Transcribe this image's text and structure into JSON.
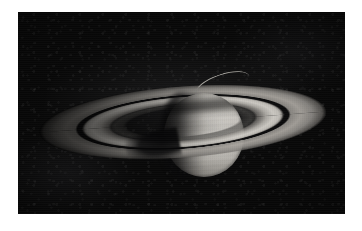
{
  "image": {
    "subject": "Saturn",
    "description": "Telescopic grayscale photograph of the planet Saturn with its ring system, seen against a black star field",
    "caption": "",
    "orientation": "landscape",
    "color_mode": "grayscale",
    "canvas": {
      "width": 362,
      "height": 231
    },
    "border": {
      "style": "white matte border",
      "color": "#ffffff"
    },
    "field": {
      "name": "sky-background",
      "color": "#080808",
      "left": 18,
      "top": 12,
      "width": 327,
      "height": 202
    }
  },
  "objects": {
    "globe": {
      "name": "saturn-globe",
      "center_x": 186,
      "center_y": 123,
      "radius_x": 40,
      "radius_y": 42,
      "lit_side": "right",
      "brightest_tone": "#d4d1cb",
      "terminator_tone": "#121111",
      "features": [
        "limb darkening",
        "zonal cloud bands",
        "equatorial zone",
        "ring shadow across northern hemisphere",
        "terminator on western limb"
      ]
    },
    "rings": {
      "name": "saturn-ring-system",
      "center_x": 165,
      "center_y": 110,
      "major_axis": 288,
      "minor_axis": 72,
      "tilt_degrees": -4.2,
      "lit_ansa": "east",
      "components": [
        {
          "label": "A ring",
          "tone": "#a8a49e",
          "position": "outer"
        },
        {
          "label": "Cassini Division",
          "tone": "#0a0a0b",
          "position": "gap between A and B"
        },
        {
          "label": "B ring",
          "tone": "#cecbc5",
          "position": "middle, brightest"
        },
        {
          "label": "C ring",
          "tone": "#4e4d4a",
          "position": "inner, faint crepe ring"
        }
      ]
    },
    "shadows": [
      {
        "label": "ring shadow on globe",
        "location": "northern hemisphere"
      },
      {
        "label": "globe shadow on rings",
        "location": "lower left ansa"
      }
    ],
    "far_ring_arc": {
      "name": "far-side-ring-arc",
      "label": "thin bright arc of far ring seen above the globe",
      "tone": "#c4c1ba"
    }
  }
}
